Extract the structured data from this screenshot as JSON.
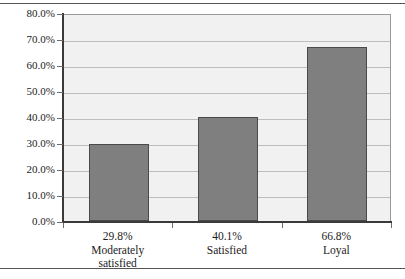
{
  "chart_data": {
    "type": "bar",
    "title": "",
    "subtitle": "",
    "xlabel": "",
    "ylabel": "",
    "categories": [
      "Moderately satisfied",
      "Satisfied",
      "Loyal"
    ],
    "category_lines": [
      [
        "Moderately",
        "satisfied"
      ],
      [
        "Satisfied"
      ],
      [
        "Loyal"
      ]
    ],
    "values": [
      29.8,
      40.1,
      66.8
    ],
    "value_labels": [
      "29.8%",
      "40.1%",
      "66.8%"
    ],
    "ylim": [
      0,
      80
    ],
    "ytick_values": [
      0,
      10,
      20,
      30,
      40,
      50,
      60,
      70,
      80
    ],
    "ytick_labels": [
      "0.0%",
      "10.0%",
      "20.0%",
      "30.0%",
      "40.0%",
      "50.0%",
      "60.0%",
      "70.0%",
      "80.0%"
    ],
    "grid": true,
    "legend": null,
    "legend_position": "none",
    "colors": {
      "bar_fill": "#7f7f7f",
      "bar_border": "#4a4a4a",
      "plot_background": "#f1f1f1",
      "gridline": "#bdbdbd",
      "axis": "#3a3a3a",
      "text": "#1c1c1c",
      "figure_background": "#ffffff",
      "rule": "#555555"
    }
  }
}
